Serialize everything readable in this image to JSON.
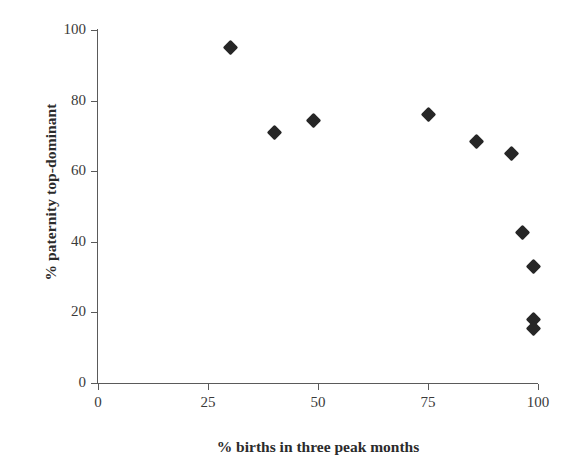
{
  "chart_data": {
    "type": "scatter",
    "title": "",
    "xlabel": "% births in three peak months",
    "ylabel": "% paternity top-dominant",
    "xlim": [
      0,
      100
    ],
    "ylim": [
      0,
      100
    ],
    "xticks": [
      0,
      25,
      50,
      75,
      100
    ],
    "yticks": [
      0,
      20,
      40,
      60,
      80,
      100
    ],
    "xtick_labels": [
      "0",
      "25",
      "50",
      "75",
      "100"
    ],
    "ytick_labels": [
      "0",
      "20",
      "40",
      "60",
      "80",
      "100"
    ],
    "grid": false,
    "legend": null,
    "marker": "filled-diamond",
    "marker_color": "#262626",
    "axis_color": "#5a5a5a",
    "background": "#ffffff",
    "series": [
      {
        "name": "primate groups",
        "points": [
          {
            "x": 30,
            "y": 95
          },
          {
            "x": 40,
            "y": 71
          },
          {
            "x": 49,
            "y": 74.5
          },
          {
            "x": 75,
            "y": 76
          },
          {
            "x": 86,
            "y": 68.5
          },
          {
            "x": 94,
            "y": 65
          },
          {
            "x": 96.5,
            "y": 42.5
          },
          {
            "x": 99,
            "y": 33
          },
          {
            "x": 99,
            "y": 18
          },
          {
            "x": 99,
            "y": 15.5
          }
        ]
      }
    ]
  }
}
